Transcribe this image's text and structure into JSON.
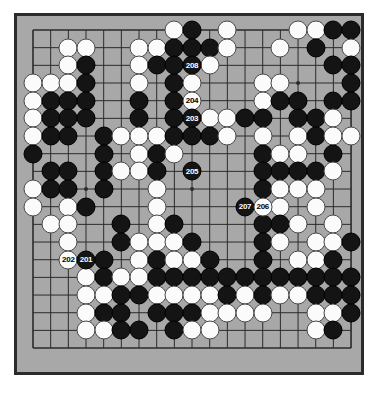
{
  "app": {
    "title": "Go Game Board Diagram",
    "board_size": 19,
    "background_color": "#ffffff"
  },
  "board": {
    "name": "go-board",
    "grid_color": "#2b2b2b",
    "board_color": "#a8a8a8",
    "border_color": "#2b2b2b",
    "black_stone_color": "#141414",
    "white_stone_color": "#fbfbfb",
    "star_points": [
      [
        3,
        3
      ],
      [
        9,
        3
      ],
      [
        15,
        3
      ],
      [
        3,
        9
      ],
      [
        9,
        9
      ],
      [
        15,
        9
      ],
      [
        3,
        15
      ],
      [
        9,
        15
      ],
      [
        15,
        15
      ]
    ],
    "stones": [
      {
        "c": 8,
        "r": 0,
        "color": "white"
      },
      {
        "c": 9,
        "r": 0,
        "color": "black"
      },
      {
        "c": 11,
        "r": 0,
        "color": "white"
      },
      {
        "c": 15,
        "r": 0,
        "color": "white"
      },
      {
        "c": 16,
        "r": 0,
        "color": "white"
      },
      {
        "c": 17,
        "r": 0,
        "color": "black"
      },
      {
        "c": 18,
        "r": 0,
        "color": "black"
      },
      {
        "c": 2,
        "r": 1,
        "color": "white"
      },
      {
        "c": 3,
        "r": 1,
        "color": "white"
      },
      {
        "c": 6,
        "r": 1,
        "color": "white"
      },
      {
        "c": 7,
        "r": 1,
        "color": "white"
      },
      {
        "c": 8,
        "r": 1,
        "color": "black"
      },
      {
        "c": 9,
        "r": 1,
        "color": "black"
      },
      {
        "c": 10,
        "r": 1,
        "color": "black"
      },
      {
        "c": 11,
        "r": 1,
        "color": "white"
      },
      {
        "c": 14,
        "r": 1,
        "color": "white"
      },
      {
        "c": 16,
        "r": 1,
        "color": "black"
      },
      {
        "c": 18,
        "r": 1,
        "color": "white"
      },
      {
        "c": 2,
        "r": 2,
        "color": "white"
      },
      {
        "c": 3,
        "r": 2,
        "color": "black"
      },
      {
        "c": 6,
        "r": 2,
        "color": "white"
      },
      {
        "c": 7,
        "r": 2,
        "color": "black"
      },
      {
        "c": 8,
        "r": 2,
        "color": "black"
      },
      {
        "c": 9,
        "r": 2,
        "color": "black",
        "label": "208"
      },
      {
        "c": 10,
        "r": 2,
        "color": "white"
      },
      {
        "c": 17,
        "r": 2,
        "color": "black"
      },
      {
        "c": 18,
        "r": 2,
        "color": "black"
      },
      {
        "c": 0,
        "r": 3,
        "color": "white"
      },
      {
        "c": 1,
        "r": 3,
        "color": "white"
      },
      {
        "c": 2,
        "r": 3,
        "color": "white"
      },
      {
        "c": 3,
        "r": 3,
        "color": "black"
      },
      {
        "c": 6,
        "r": 3,
        "color": "white"
      },
      {
        "c": 8,
        "r": 3,
        "color": "black"
      },
      {
        "c": 9,
        "r": 3,
        "color": "white"
      },
      {
        "c": 13,
        "r": 3,
        "color": "white"
      },
      {
        "c": 14,
        "r": 3,
        "color": "white"
      },
      {
        "c": 18,
        "r": 3,
        "color": "black"
      },
      {
        "c": 0,
        "r": 4,
        "color": "white"
      },
      {
        "c": 1,
        "r": 4,
        "color": "black"
      },
      {
        "c": 2,
        "r": 4,
        "color": "black"
      },
      {
        "c": 3,
        "r": 4,
        "color": "black"
      },
      {
        "c": 6,
        "r": 4,
        "color": "black"
      },
      {
        "c": 8,
        "r": 4,
        "color": "black"
      },
      {
        "c": 9,
        "r": 4,
        "color": "white",
        "label": "204"
      },
      {
        "c": 13,
        "r": 4,
        "color": "white"
      },
      {
        "c": 14,
        "r": 4,
        "color": "black"
      },
      {
        "c": 15,
        "r": 4,
        "color": "black"
      },
      {
        "c": 17,
        "r": 4,
        "color": "black"
      },
      {
        "c": 18,
        "r": 4,
        "color": "black"
      },
      {
        "c": 0,
        "r": 5,
        "color": "white"
      },
      {
        "c": 1,
        "r": 5,
        "color": "black"
      },
      {
        "c": 2,
        "r": 5,
        "color": "black"
      },
      {
        "c": 3,
        "r": 5,
        "color": "black"
      },
      {
        "c": 6,
        "r": 5,
        "color": "black"
      },
      {
        "c": 8,
        "r": 5,
        "color": "black"
      },
      {
        "c": 9,
        "r": 5,
        "color": "black",
        "label": "203"
      },
      {
        "c": 10,
        "r": 5,
        "color": "white"
      },
      {
        "c": 11,
        "r": 5,
        "color": "white"
      },
      {
        "c": 12,
        "r": 5,
        "color": "black"
      },
      {
        "c": 13,
        "r": 5,
        "color": "black"
      },
      {
        "c": 15,
        "r": 5,
        "color": "black"
      },
      {
        "c": 16,
        "r": 5,
        "color": "black"
      },
      {
        "c": 17,
        "r": 5,
        "color": "white"
      },
      {
        "c": 0,
        "r": 6,
        "color": "white"
      },
      {
        "c": 1,
        "r": 6,
        "color": "black"
      },
      {
        "c": 2,
        "r": 6,
        "color": "black"
      },
      {
        "c": 4,
        "r": 6,
        "color": "black"
      },
      {
        "c": 5,
        "r": 6,
        "color": "white"
      },
      {
        "c": 6,
        "r": 6,
        "color": "white"
      },
      {
        "c": 7,
        "r": 6,
        "color": "white"
      },
      {
        "c": 8,
        "r": 6,
        "color": "black"
      },
      {
        "c": 9,
        "r": 6,
        "color": "black"
      },
      {
        "c": 10,
        "r": 6,
        "color": "black"
      },
      {
        "c": 11,
        "r": 6,
        "color": "white"
      },
      {
        "c": 13,
        "r": 6,
        "color": "white"
      },
      {
        "c": 15,
        "r": 6,
        "color": "white"
      },
      {
        "c": 16,
        "r": 6,
        "color": "black"
      },
      {
        "c": 17,
        "r": 6,
        "color": "white"
      },
      {
        "c": 18,
        "r": 6,
        "color": "white"
      },
      {
        "c": 0,
        "r": 7,
        "color": "black"
      },
      {
        "c": 4,
        "r": 7,
        "color": "black"
      },
      {
        "c": 6,
        "r": 7,
        "color": "white"
      },
      {
        "c": 7,
        "r": 7,
        "color": "black"
      },
      {
        "c": 8,
        "r": 7,
        "color": "white"
      },
      {
        "c": 13,
        "r": 7,
        "color": "black"
      },
      {
        "c": 14,
        "r": 7,
        "color": "white"
      },
      {
        "c": 15,
        "r": 7,
        "color": "white"
      },
      {
        "c": 17,
        "r": 7,
        "color": "black"
      },
      {
        "c": 1,
        "r": 8,
        "color": "black"
      },
      {
        "c": 2,
        "r": 8,
        "color": "black"
      },
      {
        "c": 4,
        "r": 8,
        "color": "black"
      },
      {
        "c": 5,
        "r": 8,
        "color": "white"
      },
      {
        "c": 6,
        "r": 8,
        "color": "white"
      },
      {
        "c": 7,
        "r": 8,
        "color": "black"
      },
      {
        "c": 9,
        "r": 8,
        "color": "black",
        "label": "205"
      },
      {
        "c": 13,
        "r": 8,
        "color": "black"
      },
      {
        "c": 14,
        "r": 8,
        "color": "black"
      },
      {
        "c": 15,
        "r": 8,
        "color": "black"
      },
      {
        "c": 16,
        "r": 8,
        "color": "black"
      },
      {
        "c": 17,
        "r": 8,
        "color": "white"
      },
      {
        "c": 0,
        "r": 9,
        "color": "white"
      },
      {
        "c": 1,
        "r": 9,
        "color": "black"
      },
      {
        "c": 2,
        "r": 9,
        "color": "black"
      },
      {
        "c": 4,
        "r": 9,
        "color": "black"
      },
      {
        "c": 7,
        "r": 9,
        "color": "white"
      },
      {
        "c": 13,
        "r": 9,
        "color": "black"
      },
      {
        "c": 14,
        "r": 9,
        "color": "white"
      },
      {
        "c": 15,
        "r": 9,
        "color": "white"
      },
      {
        "c": 16,
        "r": 9,
        "color": "white"
      },
      {
        "c": 0,
        "r": 10,
        "color": "white"
      },
      {
        "c": 2,
        "r": 10,
        "color": "white"
      },
      {
        "c": 3,
        "r": 10,
        "color": "black"
      },
      {
        "c": 7,
        "r": 10,
        "color": "white"
      },
      {
        "c": 12,
        "r": 10,
        "color": "black",
        "label": "207"
      },
      {
        "c": 13,
        "r": 10,
        "color": "white",
        "label": "206"
      },
      {
        "c": 14,
        "r": 10,
        "color": "white"
      },
      {
        "c": 16,
        "r": 10,
        "color": "white"
      },
      {
        "c": 1,
        "r": 11,
        "color": "white"
      },
      {
        "c": 2,
        "r": 11,
        "color": "white"
      },
      {
        "c": 5,
        "r": 11,
        "color": "black"
      },
      {
        "c": 7,
        "r": 11,
        "color": "white"
      },
      {
        "c": 8,
        "r": 11,
        "color": "black"
      },
      {
        "c": 13,
        "r": 11,
        "color": "black"
      },
      {
        "c": 14,
        "r": 11,
        "color": "black"
      },
      {
        "c": 15,
        "r": 11,
        "color": "white"
      },
      {
        "c": 17,
        "r": 11,
        "color": "white"
      },
      {
        "c": 2,
        "r": 12,
        "color": "white"
      },
      {
        "c": 5,
        "r": 12,
        "color": "black"
      },
      {
        "c": 6,
        "r": 12,
        "color": "white"
      },
      {
        "c": 7,
        "r": 12,
        "color": "white"
      },
      {
        "c": 8,
        "r": 12,
        "color": "white"
      },
      {
        "c": 9,
        "r": 12,
        "color": "black"
      },
      {
        "c": 13,
        "r": 12,
        "color": "black"
      },
      {
        "c": 14,
        "r": 12,
        "color": "white"
      },
      {
        "c": 16,
        "r": 12,
        "color": "white"
      },
      {
        "c": 17,
        "r": 12,
        "color": "white"
      },
      {
        "c": 18,
        "r": 12,
        "color": "black"
      },
      {
        "c": 2,
        "r": 13,
        "color": "white",
        "label": "202"
      },
      {
        "c": 3,
        "r": 13,
        "color": "black",
        "label": "201"
      },
      {
        "c": 4,
        "r": 13,
        "color": "black"
      },
      {
        "c": 6,
        "r": 13,
        "color": "white"
      },
      {
        "c": 7,
        "r": 13,
        "color": "black"
      },
      {
        "c": 8,
        "r": 13,
        "color": "white"
      },
      {
        "c": 9,
        "r": 13,
        "color": "white"
      },
      {
        "c": 10,
        "r": 13,
        "color": "black"
      },
      {
        "c": 13,
        "r": 13,
        "color": "black"
      },
      {
        "c": 15,
        "r": 13,
        "color": "white"
      },
      {
        "c": 16,
        "r": 13,
        "color": "white"
      },
      {
        "c": 17,
        "r": 13,
        "color": "black"
      },
      {
        "c": 3,
        "r": 14,
        "color": "white"
      },
      {
        "c": 4,
        "r": 14,
        "color": "black"
      },
      {
        "c": 5,
        "r": 14,
        "color": "white"
      },
      {
        "c": 6,
        "r": 14,
        "color": "white"
      },
      {
        "c": 7,
        "r": 14,
        "color": "black"
      },
      {
        "c": 8,
        "r": 14,
        "color": "black"
      },
      {
        "c": 9,
        "r": 14,
        "color": "black"
      },
      {
        "c": 10,
        "r": 14,
        "color": "black"
      },
      {
        "c": 11,
        "r": 14,
        "color": "black"
      },
      {
        "c": 12,
        "r": 14,
        "color": "black"
      },
      {
        "c": 13,
        "r": 14,
        "color": "black"
      },
      {
        "c": 14,
        "r": 14,
        "color": "black"
      },
      {
        "c": 15,
        "r": 14,
        "color": "black"
      },
      {
        "c": 16,
        "r": 14,
        "color": "black"
      },
      {
        "c": 17,
        "r": 14,
        "color": "black"
      },
      {
        "c": 18,
        "r": 14,
        "color": "black"
      },
      {
        "c": 3,
        "r": 15,
        "color": "white"
      },
      {
        "c": 4,
        "r": 15,
        "color": "white"
      },
      {
        "c": 5,
        "r": 15,
        "color": "black"
      },
      {
        "c": 6,
        "r": 15,
        "color": "black"
      },
      {
        "c": 7,
        "r": 15,
        "color": "white"
      },
      {
        "c": 8,
        "r": 15,
        "color": "white"
      },
      {
        "c": 9,
        "r": 15,
        "color": "white"
      },
      {
        "c": 10,
        "r": 15,
        "color": "white"
      },
      {
        "c": 11,
        "r": 15,
        "color": "black"
      },
      {
        "c": 12,
        "r": 15,
        "color": "white"
      },
      {
        "c": 13,
        "r": 15,
        "color": "black"
      },
      {
        "c": 14,
        "r": 15,
        "color": "white"
      },
      {
        "c": 15,
        "r": 15,
        "color": "white"
      },
      {
        "c": 16,
        "r": 15,
        "color": "black"
      },
      {
        "c": 17,
        "r": 15,
        "color": "black"
      },
      {
        "c": 18,
        "r": 15,
        "color": "black"
      },
      {
        "c": 3,
        "r": 16,
        "color": "white"
      },
      {
        "c": 4,
        "r": 16,
        "color": "black"
      },
      {
        "c": 5,
        "r": 16,
        "color": "black"
      },
      {
        "c": 7,
        "r": 16,
        "color": "black"
      },
      {
        "c": 8,
        "r": 16,
        "color": "black"
      },
      {
        "c": 9,
        "r": 16,
        "color": "black"
      },
      {
        "c": 10,
        "r": 16,
        "color": "white"
      },
      {
        "c": 11,
        "r": 16,
        "color": "white"
      },
      {
        "c": 12,
        "r": 16,
        "color": "white"
      },
      {
        "c": 13,
        "r": 16,
        "color": "white"
      },
      {
        "c": 16,
        "r": 16,
        "color": "white"
      },
      {
        "c": 17,
        "r": 16,
        "color": "white"
      },
      {
        "c": 18,
        "r": 16,
        "color": "black"
      },
      {
        "c": 3,
        "r": 17,
        "color": "white"
      },
      {
        "c": 4,
        "r": 17,
        "color": "white"
      },
      {
        "c": 5,
        "r": 17,
        "color": "black"
      },
      {
        "c": 6,
        "r": 17,
        "color": "black"
      },
      {
        "c": 8,
        "r": 17,
        "color": "black"
      },
      {
        "c": 9,
        "r": 17,
        "color": "white"
      },
      {
        "c": 10,
        "r": 17,
        "color": "white"
      },
      {
        "c": 16,
        "r": 17,
        "color": "white"
      },
      {
        "c": 17,
        "r": 17,
        "color": "black"
      }
    ],
    "move_labels": [
      {
        "number": "201",
        "color": "black"
      },
      {
        "number": "202",
        "color": "white"
      },
      {
        "number": "203",
        "color": "black"
      },
      {
        "number": "204",
        "color": "white"
      },
      {
        "number": "205",
        "color": "black"
      },
      {
        "number": "206",
        "color": "white"
      },
      {
        "number": "207",
        "color": "black"
      },
      {
        "number": "208",
        "color": "black"
      }
    ]
  }
}
